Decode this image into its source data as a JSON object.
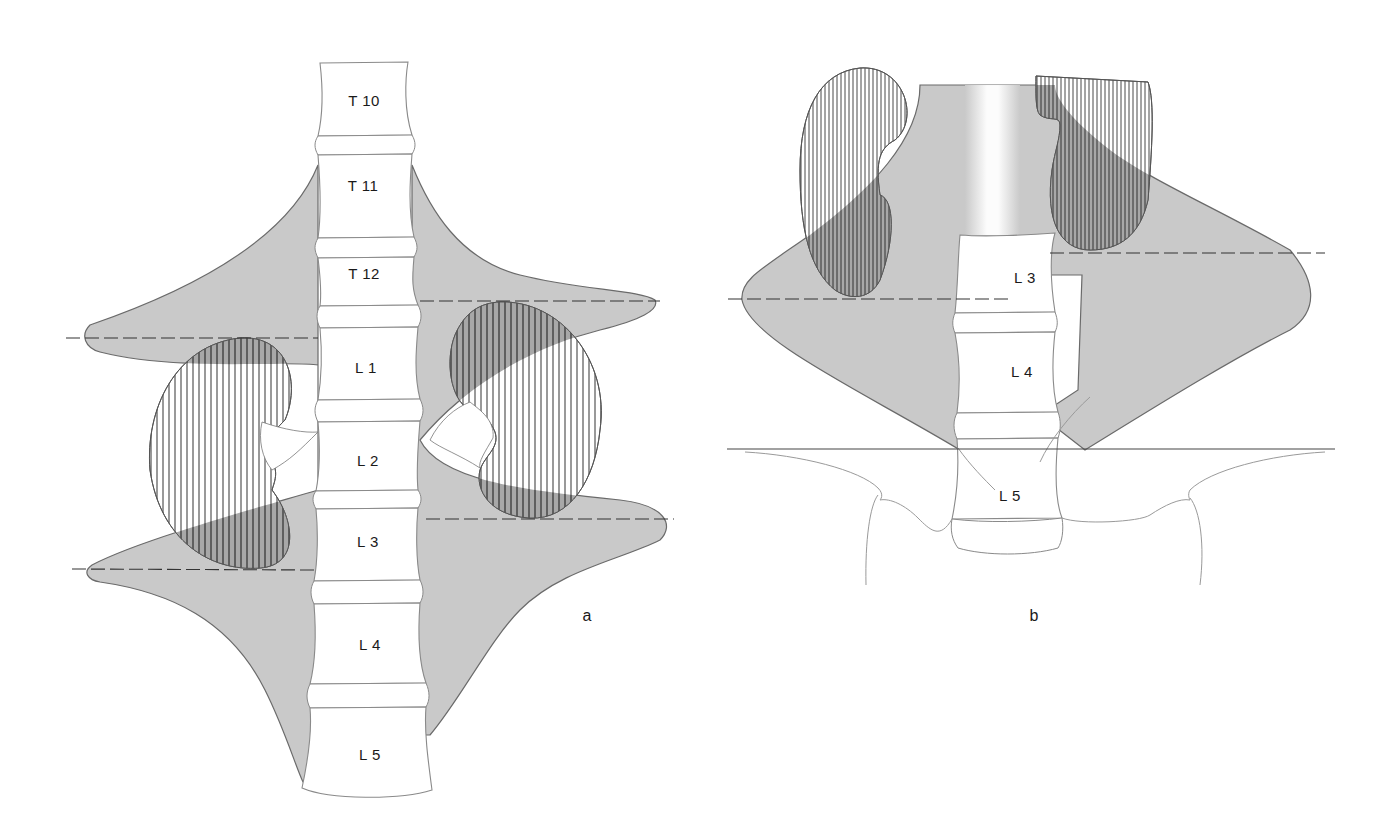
{
  "figure": {
    "panel_a": {
      "label": "a",
      "vertebrae": [
        "T 10",
        "T 11",
        "T 12",
        "L 1",
        "L 2",
        "L 3",
        "L 4",
        "L 5"
      ]
    },
    "panel_b": {
      "label": "b",
      "vertebrae": [
        "L 3",
        "L 4",
        "L 5"
      ]
    },
    "colors": {
      "shaded_region": "#c9c9c9",
      "outline": "#6a6a6a",
      "hatch": "#333333",
      "background": "#ffffff"
    }
  }
}
